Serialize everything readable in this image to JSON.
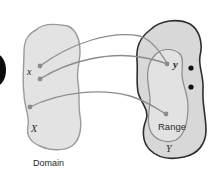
{
  "diagram": {
    "type": "function-mapping",
    "domain": {
      "label": "Domain",
      "set_label": "X",
      "element_label": "x",
      "fill": "#e3e3e3",
      "stroke": "#9a9a9a"
    },
    "codomain": {
      "set_label": "Y",
      "element_label": "y",
      "fill": "#d8d8d8",
      "stroke": "#2e2e2e"
    },
    "range": {
      "label": "Range",
      "fill": "#e0e0e0",
      "stroke": "#8a8a8a"
    },
    "arrow_color": "#8c8c8c",
    "point_color": "#8c8c8c",
    "unmapped_point_color": "#111111",
    "mappings": [
      {
        "from": "x (upper point)",
        "to": "y"
      },
      {
        "from": "x (lower point)",
        "to": "y"
      },
      {
        "from": "lower domain point",
        "to": "range point"
      }
    ],
    "unmapped_codomain_points": 2
  }
}
